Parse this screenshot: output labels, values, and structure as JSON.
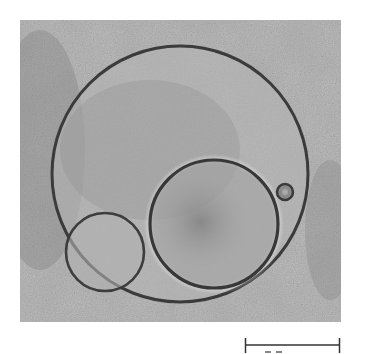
{
  "figure": {
    "type": "microscopy-micrograph",
    "background_color": "#ffffff",
    "image_tone": "#b9b9b9",
    "membrane_color": "#3a3a3a",
    "image_frame": {
      "x": 20,
      "y": 20,
      "width": 321,
      "height": 302
    },
    "objects": [
      {
        "name": "large-vesicle",
        "cx": 180,
        "cy": 174,
        "r": 128
      },
      {
        "name": "medium-vesicle",
        "cx": 214,
        "cy": 224,
        "r": 64
      },
      {
        "name": "small-vesicle",
        "cx": 105,
        "cy": 252,
        "r": 39
      },
      {
        "name": "tiny-vesicle",
        "cx": 285,
        "cy": 192,
        "r": 9
      }
    ]
  },
  "scale_bar": {
    "x1": 245,
    "x2": 340,
    "y": 345,
    "label": ""
  }
}
